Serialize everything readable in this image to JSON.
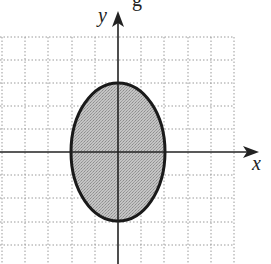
{
  "figure": {
    "top_cropped_text": "g",
    "axes": {
      "x_label": "x",
      "y_label": "y",
      "origin_px": [
        118,
        152
      ],
      "unit_px": 23.3
    },
    "grid": {
      "x_range_units": [
        -5,
        5
      ],
      "y_range_units": [
        -4,
        5
      ],
      "style": "dotted",
      "color": "#9a9a9a"
    },
    "ellipse": {
      "center": [
        0,
        0
      ],
      "semi_axis_x": 2,
      "semi_axis_y": 3,
      "fill": "#bdbdbd",
      "stroke": "#1a1a1a",
      "description": "Shaded interior of ellipse x^2/4 + y^2/9 <= 1"
    }
  }
}
